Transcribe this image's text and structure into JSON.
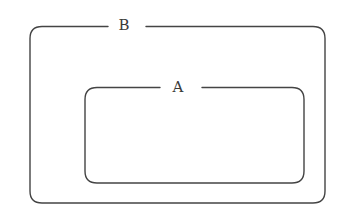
{
  "diagram": {
    "type": "nested-set-diagram",
    "stroke_color": "#444444",
    "background_color": "#ffffff",
    "sets": [
      {
        "id": "B",
        "label": "B",
        "role": "outer",
        "box": {
          "x": 30,
          "y": 26,
          "width": 295,
          "height": 177,
          "radius": 12
        },
        "label_gap": {
          "start_x": 108,
          "end_x": 146
        }
      },
      {
        "id": "A",
        "label": "A",
        "role": "inner",
        "contained_in": "B",
        "box": {
          "x": 85,
          "y": 87,
          "width": 219,
          "height": 96,
          "radius": 12
        },
        "label_gap": {
          "start_x": 160,
          "end_x": 202
        }
      }
    ]
  }
}
